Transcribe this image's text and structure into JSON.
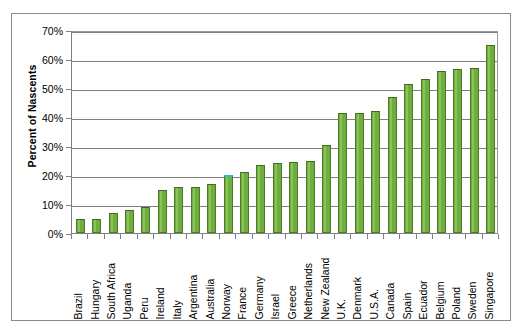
{
  "chart_data": {
    "type": "bar",
    "title": "",
    "subtitle": "",
    "xlabel": "",
    "ylabel": "Percent of Nascents",
    "ylim": [
      0,
      70
    ],
    "y_tick_labels": [
      "0%",
      "10%",
      "20%",
      "30%",
      "40%",
      "50%",
      "60%",
      "70%"
    ],
    "y_tick_values": [
      0,
      10,
      20,
      30,
      40,
      50,
      60,
      70
    ],
    "grid": true,
    "legend": "none",
    "bar_color": "#6fae3d",
    "bar_border_color": "#4b7a2a",
    "highlight_color": "#24b7d8",
    "highlight_category": "Norway",
    "categories": [
      "Brazil",
      "Hungary",
      "South Africa",
      "Uganda",
      "Peru",
      "Ireland",
      "Italy",
      "Argentina",
      "Australia",
      "Norway",
      "France",
      "Germany",
      "Israel",
      "Greece",
      "Netherlands",
      "New Zealand",
      "U.K.",
      "Denmark",
      "U.S.A.",
      "Canada",
      "Spain",
      "Ecuador",
      "Belgium",
      "Poland",
      "Sweden",
      "Singapore"
    ],
    "values": [
      5,
      5,
      7,
      8,
      9,
      15,
      16,
      16,
      17,
      20,
      21,
      23.5,
      24,
      24.5,
      25,
      30.5,
      41.5,
      41.5,
      42,
      47,
      51.5,
      53,
      56,
      56.5,
      57,
      65
    ],
    "value_labels": [
      "5%",
      "5%",
      "7%",
      "8%",
      "9%",
      "15%",
      "16%",
      "16%",
      "17%",
      "20%",
      "21%",
      "23.5%",
      "24%",
      "24.5%",
      "25%",
      "30.5%",
      "41.5%",
      "41.5%",
      "42%",
      "47%",
      "51.5%",
      "53%",
      "56%",
      "56.5%",
      "57%",
      "65%"
    ]
  }
}
